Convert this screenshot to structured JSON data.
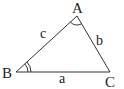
{
  "diagram": {
    "type": "triangle",
    "vertices": [
      {
        "id": "A",
        "label": "A"
      },
      {
        "id": "B",
        "label": "B"
      },
      {
        "id": "C",
        "label": "C"
      }
    ],
    "sides": [
      {
        "id": "a",
        "label": "a",
        "between": [
          "B",
          "C"
        ]
      },
      {
        "id": "b",
        "label": "b",
        "between": [
          "A",
          "C"
        ]
      },
      {
        "id": "c",
        "label": "c",
        "between": [
          "A",
          "B"
        ]
      }
    ],
    "angle_marks": [
      {
        "vertex": "A",
        "arcs": 1
      },
      {
        "vertex": "B",
        "arcs": 2
      }
    ],
    "colors": {
      "stroke": "#333333",
      "text": "#222222",
      "background": "#ffffff"
    }
  }
}
